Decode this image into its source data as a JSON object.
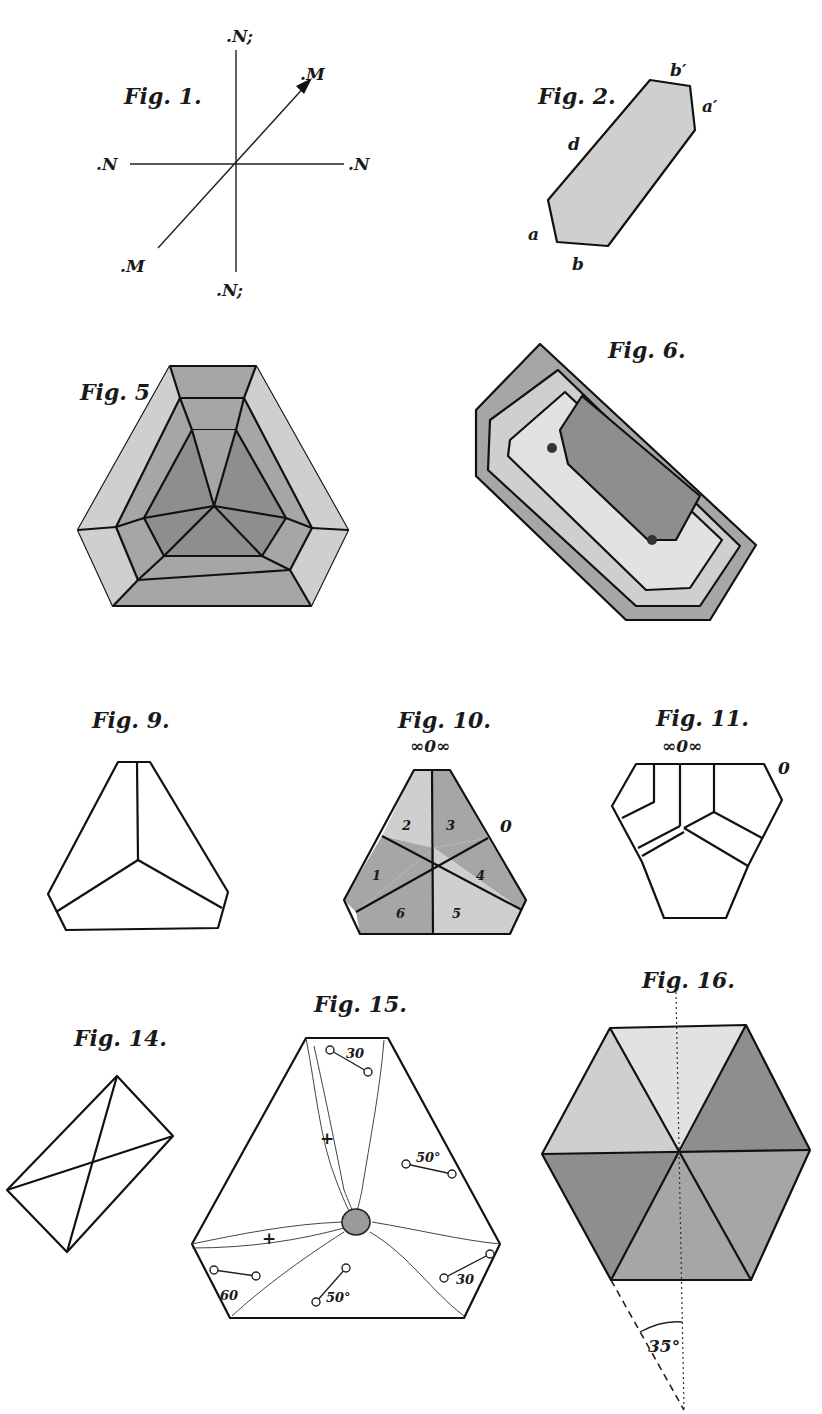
{
  "plate": {
    "figures": [
      {
        "id": "fig1",
        "caption": "Fig. 1.",
        "labels": {
          "top": ".N;",
          "bottom": ".N;",
          "left": ".N",
          "right": ".N",
          "arrow_head": ".M",
          "arrow_tail": ".M"
        },
        "description": "Axis cross with diagonal arrow M–M"
      },
      {
        "id": "fig2",
        "caption": "Fig. 2.",
        "labels": {
          "top": "b′",
          "right": "a′",
          "side": "d",
          "left": "a",
          "bottom": "b"
        },
        "description": "Elongated shaded hexagonal crystal section"
      },
      {
        "id": "fig5",
        "caption": "Fig. 5.",
        "description": "Truncated trigonal crystal with concentric shaded zones"
      },
      {
        "id": "fig6",
        "caption": "Fig. 6.",
        "description": "Tilted tabular crystal with nested growth zones"
      },
      {
        "id": "fig9",
        "caption": "Fig. 9.",
        "description": "Truncated triangular outline with three faces meeting at center"
      },
      {
        "id": "fig10",
        "caption": "Fig. 10.",
        "top_label": "∞0∞",
        "side_label": "0",
        "sectors": [
          "1",
          "2",
          "3",
          "4",
          "5",
          "6"
        ],
        "description": "Truncated triangle divided into six numbered sectors"
      },
      {
        "id": "fig11",
        "caption": "Fig. 11.",
        "top_label": "∞0∞",
        "side_label": "0",
        "description": "Irregular polygon outline with internal zone boundaries"
      },
      {
        "id": "fig14",
        "caption": "Fig. 14.",
        "description": "Tilted rectangle with both diagonals"
      },
      {
        "id": "fig15",
        "caption": "Fig. 15.",
        "angle_labels": [
          "30",
          "50°",
          "30",
          "50°",
          "60"
        ],
        "cross_marks": [
          "+",
          "+"
        ],
        "description": "Truncated triangle with optical axis pairs and central inclusion"
      },
      {
        "id": "fig16",
        "caption": "Fig. 16.",
        "angle_label": "35°",
        "description": "Hexagon of six shaded triangular sectors with dashed extinction angle"
      }
    ]
  },
  "colors": {
    "ink": "#111111",
    "paper": "#ffffff",
    "shade_dark": "#8e8e8e",
    "shade_mid": "#a6a6a6",
    "shade_light": "#cfcfcf",
    "shade_pale": "#e2e2e2"
  }
}
